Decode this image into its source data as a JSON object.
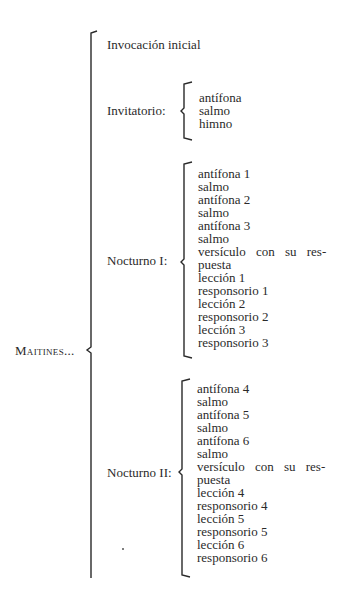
{
  "root": {
    "label": "Maitines..."
  },
  "sections": {
    "invocacion": {
      "label": "Invocación inicial"
    },
    "invitatorio": {
      "label": "Invitatorio:",
      "items": [
        "antífona",
        "salmo",
        "himno"
      ]
    },
    "nocturno1": {
      "label": "Nocturno I:",
      "items": [
        "antífona 1",
        "salmo",
        "antífona 2",
        "salmo",
        "antífona 3",
        "salmo",
        "versículo con su res-",
        "puesta",
        "lección 1",
        "responsorio 1",
        "lección 2",
        "responsorio 2",
        "lección 3",
        "responsorio 3"
      ]
    },
    "nocturno2": {
      "label": "Nocturno II:",
      "items": [
        "antífona 4",
        "salmo",
        "antífona 5",
        "salmo",
        "antífona 6",
        "salmo",
        "versículo con su res-",
        "puesta",
        "lección 4",
        "responsorio 4",
        "lección 5",
        "responsorio 5",
        "lección 6",
        "responsorio 6"
      ]
    }
  },
  "colors": {
    "ink": "#2a2a2a",
    "background": "#ffffff"
  }
}
